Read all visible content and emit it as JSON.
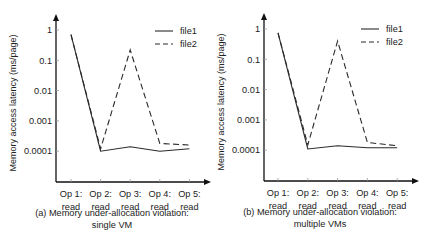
{
  "chart_data": [
    {
      "type": "line",
      "title": "(a) Memory under-allocation violation: single VM",
      "caption_line1": "(a) Memory under-allocation violation:",
      "caption_line2": "single VM",
      "xlabel": "",
      "ylabel": "Memory access latency (ms/page)",
      "yscale": "log",
      "ylim": [
        1e-05,
        1
      ],
      "yticks": [
        "1",
        "0.1",
        "0.01",
        "0.001",
        "0.0001"
      ],
      "categories": [
        "Op 1: read",
        "Op 2: read",
        "Op 3: read",
        "Op 4: read",
        "Op 5: read"
      ],
      "category_lines": [
        [
          "Op 1:",
          "read"
        ],
        [
          "Op 2:",
          "read"
        ],
        [
          "Op 3:",
          "read"
        ],
        [
          "Op 4:",
          "read"
        ],
        [
          "Op 5:",
          "read"
        ]
      ],
      "grid": false,
      "legend_position": "upper right",
      "series": [
        {
          "name": "file1",
          "style": "solid",
          "values": [
            0.7,
            0.0001,
            0.00014,
            0.0001,
            0.00012
          ]
        },
        {
          "name": "file2",
          "style": "dashed",
          "values": [
            0.7,
            0.00012,
            0.22,
            0.00018,
            0.00016
          ]
        }
      ]
    },
    {
      "type": "line",
      "title": "(b) Memory under-allocation violation: multiple VMs",
      "caption_line1": "(b) Memory under-allocation violation:",
      "caption_line2": "multiple VMs",
      "xlabel": "",
      "ylabel": "Memory access latency (ms/page)",
      "yscale": "log",
      "ylim": [
        1e-05,
        1
      ],
      "yticks": [
        "1",
        "0.1",
        "0.01",
        "0.001",
        "0.0001"
      ],
      "categories": [
        "Op 1: read",
        "Op 2: read",
        "Op 3: read",
        "Op 4: read",
        "Op 5: read"
      ],
      "category_lines": [
        [
          "Op 1:",
          "read"
        ],
        [
          "Op 2:",
          "read"
        ],
        [
          "Op 3:",
          "read"
        ],
        [
          "Op 4:",
          "read"
        ],
        [
          "Op 5:",
          "read"
        ]
      ],
      "grid": false,
      "legend_position": "upper right",
      "series": [
        {
          "name": "file1",
          "style": "solid",
          "values": [
            0.75,
            0.00011,
            0.00014,
            0.00012,
            0.00012
          ]
        },
        {
          "name": "file2",
          "style": "dashed",
          "values": [
            0.75,
            0.00015,
            0.4,
            0.00018,
            0.00014
          ]
        }
      ]
    }
  ],
  "colors": {
    "line": "#2a2a2a",
    "axis": "#111111",
    "text": "#222222"
  },
  "footer_faint_text": "Fig. continued"
}
